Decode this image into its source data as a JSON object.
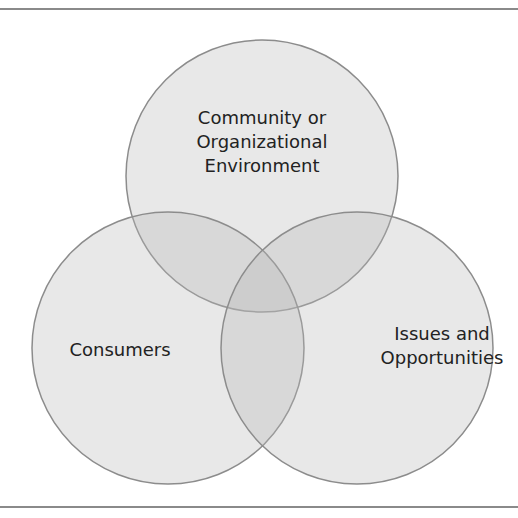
{
  "diagram": {
    "type": "venn",
    "colors": {
      "fill": "#e6e6e6",
      "stroke": "#8c8c8c",
      "rule": "#8a8a8a",
      "text": "#222222"
    },
    "circles": [
      {
        "id": "top",
        "label_lines": [
          "Community or",
          "Organizational",
          "Environment"
        ],
        "cx": 262,
        "cy": 176,
        "r": 136
      },
      {
        "id": "left",
        "label_lines": [
          "Consumers"
        ],
        "cx": 168,
        "cy": 348,
        "r": 136
      },
      {
        "id": "right",
        "label_lines": [
          "Issues and",
          "Opportunities"
        ],
        "cx": 357,
        "cy": 348,
        "r": 136
      }
    ]
  }
}
